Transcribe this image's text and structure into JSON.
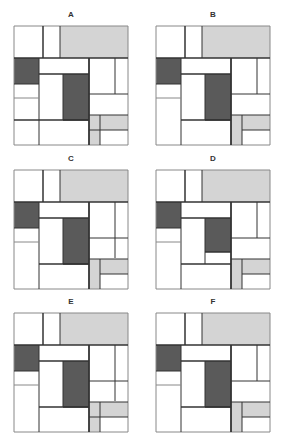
{
  "colors": {
    "dark": "#5a5a5a",
    "light": "#d4d4d4",
    "white": "#ffffff",
    "line": "#333333",
    "thin_line": "#888888"
  },
  "panels": [
    {
      "id": "A",
      "label": "A",
      "x": 6,
      "y": 10,
      "dark_bottom": 94,
      "white_below_dark": false,
      "right_vertical_end": 68,
      "left_bottom_line_full": true,
      "gray_cross_line": true
    },
    {
      "id": "B",
      "label": "B",
      "x": 148,
      "y": 10,
      "dark_bottom": 94,
      "white_below_dark": false,
      "right_vertical_end": 68,
      "left_bottom_line_full": false,
      "gray_cross_line": false
    },
    {
      "id": "C",
      "label": "C",
      "x": 6,
      "y": 154,
      "dark_bottom": 94,
      "white_below_dark": false,
      "right_vertical_end": 88,
      "left_bottom_line_full": false,
      "gray_cross_line": false
    },
    {
      "id": "D",
      "label": "D",
      "x": 148,
      "y": 154,
      "dark_bottom": 82,
      "white_below_dark": true,
      "right_vertical_end": 68,
      "left_bottom_line_full": false,
      "gray_cross_line": false
    },
    {
      "id": "E",
      "label": "E",
      "x": 6,
      "y": 297,
      "dark_bottom": 94,
      "white_below_dark": false,
      "right_vertical_end": 88,
      "left_bottom_line_full": false,
      "gray_cross_line": true
    },
    {
      "id": "F",
      "label": "F",
      "x": 148,
      "y": 297,
      "dark_bottom": 94,
      "white_below_dark": false,
      "right_vertical_end": 68,
      "left_bottom_line_full": false,
      "gray_cross_line": false
    }
  ]
}
